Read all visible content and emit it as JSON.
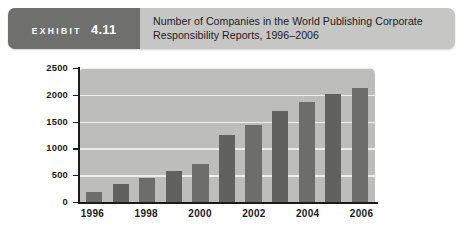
{
  "header": {
    "exhibit_word": "EXHIBIT",
    "exhibit_number": "4.11",
    "title": "Number of Companies in the World Publishing Corporate Responsibility Reports, 1996–2006"
  },
  "colors": {
    "band_background": "#c6c6c4",
    "tag_background": "#6f6f6d",
    "plot_background": "#bdbdbb",
    "bar_fill": "#6d6d6b",
    "gridline": "#eeeeec",
    "axis": "#1b1b1b"
  },
  "chart_data": {
    "type": "bar",
    "title": "Number of Companies in the World Publishing Corporate Responsibility Reports, 1996–2006",
    "xlabel": "",
    "ylabel": "",
    "categories": [
      "1996",
      "1997",
      "1998",
      "1999",
      "2000",
      "2001",
      "2002",
      "2003",
      "2004",
      "2005",
      "2006"
    ],
    "values": [
      190,
      330,
      440,
      570,
      710,
      1250,
      1430,
      1700,
      1870,
      2010,
      2130
    ],
    "ylim": [
      0,
      2500
    ],
    "yticks": [
      0,
      500,
      1000,
      1500,
      2000,
      2500
    ],
    "ytick_labels": [
      "0",
      "500",
      "1000",
      "1500",
      "2000",
      "2500"
    ],
    "xtick_labels": [
      "1996",
      "1998",
      "2000",
      "2002",
      "2004",
      "2006"
    ],
    "xtick_categories": [
      "1996",
      "1998",
      "2000",
      "2002",
      "2004",
      "2006"
    ],
    "grid": true,
    "legend": null,
    "legend_position": "none"
  }
}
